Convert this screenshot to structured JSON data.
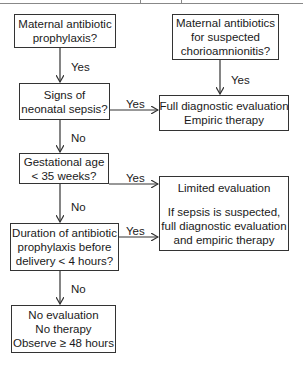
{
  "diagram": {
    "nodes": {
      "maternal_prophylaxis": [
        "Maternal antibiotic",
        "prophylaxis?"
      ],
      "maternal_chorio": [
        "Maternal antibiotics",
        "for suspected",
        "chorioamnionitis?"
      ],
      "signs_sepsis": [
        "Signs of",
        "neonatal sepsis?"
      ],
      "full_eval": [
        "Full diagnostic evaluation",
        "Empiric therapy"
      ],
      "gest_age": [
        "Gestational age",
        "< 35 weeks?"
      ],
      "limited_eval": [
        "Limited evaluation",
        "",
        "If sepsis is suspected,",
        "full diagnostic evaluation",
        "and empiric therapy"
      ],
      "duration": [
        "Duration of antibiotic",
        "prophylaxis before",
        "delivery < 4 hours?"
      ],
      "no_eval": [
        "No evaluation",
        "No therapy",
        "Observe ≥ 48 hours"
      ]
    },
    "edges": {
      "prophylaxis_to_signs": "Yes",
      "chorio_to_full": "Yes",
      "signs_to_full": "Yes",
      "signs_to_gest": "No",
      "gest_to_limited": "Yes",
      "gest_to_duration": "No",
      "duration_to_limited": "Yes",
      "duration_to_noeval": "No"
    }
  }
}
